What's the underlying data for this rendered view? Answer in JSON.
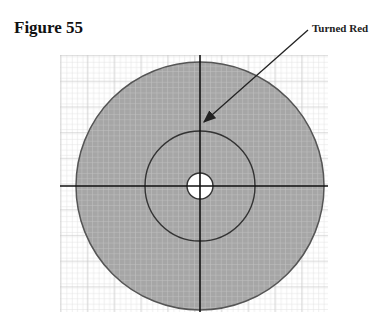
{
  "figure": {
    "title": "Figure 55",
    "callout_label": "Turned Red"
  },
  "diagram": {
    "type": "concentric-circles-on-grid",
    "grid": {
      "x": 60,
      "y": 55,
      "width": 268,
      "height": 257,
      "minor_step": 5.36,
      "major_every": 5,
      "color": "#d6d6d6",
      "major_color": "#bdbdbd"
    },
    "center": {
      "x": 200,
      "y": 186
    },
    "outer_circle": {
      "r": 124,
      "fill": "#a6a6a6",
      "stroke": "#555555"
    },
    "middle_circle": {
      "r": 55,
      "fill": "#a6a6a6",
      "stroke": "#333333"
    },
    "inner_hole": {
      "r": 13,
      "fill": "#ffffff",
      "stroke": "#333333"
    },
    "axes_color": "#111111",
    "arrow": {
      "x1": 308,
      "y1": 30,
      "x2": 203,
      "y2": 122,
      "color": "#222222"
    }
  }
}
